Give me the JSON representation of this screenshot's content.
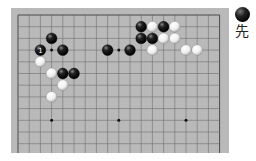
{
  "board": {
    "cols": 19,
    "visible_rows": 12,
    "origin": {
      "x": 7,
      "y": 7
    },
    "spacing": {
      "x": 11.2,
      "y": 11.7
    },
    "colors": {
      "wood": "#b9b9b9",
      "line": "#6f6f6f",
      "edge": "#4a4a4a"
    },
    "star_points": [
      [
        3,
        3
      ],
      [
        9,
        3
      ],
      [
        15,
        3
      ],
      [
        3,
        9
      ],
      [
        9,
        9
      ],
      [
        15,
        9
      ]
    ],
    "stones": [
      {
        "c": 11,
        "r": 1,
        "color": "black"
      },
      {
        "c": 12,
        "r": 1,
        "color": "white"
      },
      {
        "c": 13,
        "r": 1,
        "color": "black"
      },
      {
        "c": 14,
        "r": 1,
        "color": "white"
      },
      {
        "c": 3,
        "r": 2,
        "color": "black"
      },
      {
        "c": 11,
        "r": 2,
        "color": "black"
      },
      {
        "c": 12,
        "r": 2,
        "color": "black"
      },
      {
        "c": 13,
        "r": 2,
        "color": "white"
      },
      {
        "c": 14,
        "r": 2,
        "color": "white"
      },
      {
        "c": 2,
        "r": 3,
        "color": "black",
        "label": "1"
      },
      {
        "c": 4,
        "r": 3,
        "color": "black"
      },
      {
        "c": 8,
        "r": 3,
        "color": "black"
      },
      {
        "c": 10,
        "r": 3,
        "color": "black"
      },
      {
        "c": 12,
        "r": 3,
        "color": "white"
      },
      {
        "c": 15,
        "r": 3,
        "color": "white"
      },
      {
        "c": 16,
        "r": 3,
        "color": "white"
      },
      {
        "c": 2,
        "r": 4,
        "color": "white"
      },
      {
        "c": 3,
        "r": 5,
        "color": "white"
      },
      {
        "c": 4,
        "r": 5,
        "color": "black"
      },
      {
        "c": 5,
        "r": 5,
        "color": "black"
      },
      {
        "c": 4,
        "r": 6,
        "color": "white"
      },
      {
        "c": 3,
        "r": 7,
        "color": "white"
      }
    ]
  },
  "turn": {
    "stone_color": "black",
    "label": "先"
  }
}
